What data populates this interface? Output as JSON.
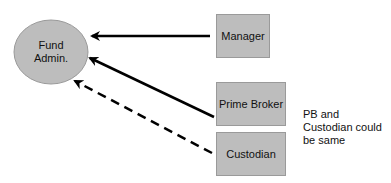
{
  "diagram": {
    "nodes": [
      {
        "id": "fund-admin",
        "label": "Fund\nAdmin.",
        "shape": "ellipse"
      },
      {
        "id": "manager",
        "label": "Manager",
        "shape": "rect"
      },
      {
        "id": "prime-broker",
        "label": "Prime Broker",
        "shape": "rect"
      },
      {
        "id": "custodian",
        "label": "Custodian",
        "shape": "rect"
      }
    ],
    "edges": [
      {
        "from": "manager",
        "to": "fund-admin",
        "style": "solid"
      },
      {
        "from": "prime-broker",
        "to": "fund-admin",
        "style": "solid"
      },
      {
        "from": "custodian",
        "to": "fund-admin",
        "style": "dashed"
      }
    ],
    "note": "PB and\nCustodian could\nbe same",
    "colors": {
      "fill": "#bdbdbd",
      "stroke": "#9a9a9a",
      "arrow": "#000000"
    }
  }
}
